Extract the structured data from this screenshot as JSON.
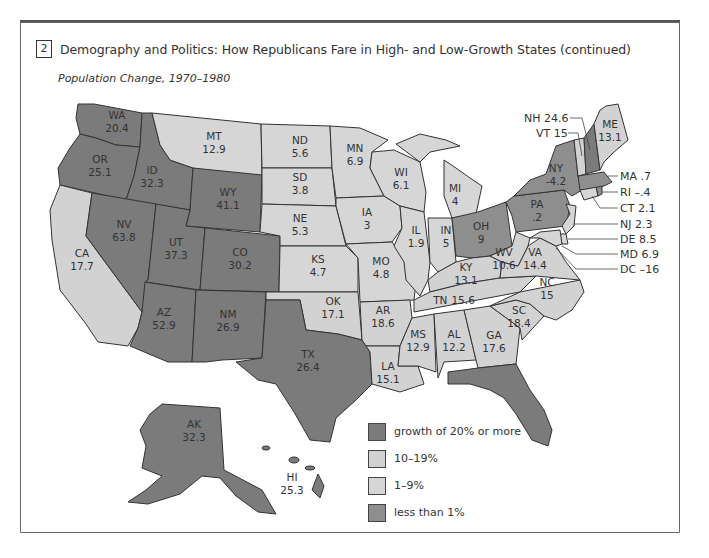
{
  "figure": {
    "number": "2",
    "title": "Demography and Politics: How Republicans Fare in High- and Low-Growth States (continued)",
    "subtitle": "Population Change, 1970–1980"
  },
  "colors": {
    "high": "#7b7b7b",
    "mid": "#d2d2d2",
    "low": "#d6d6d6",
    "neg": "#8e8e8e",
    "border": "#333333"
  },
  "legend": [
    {
      "key": "high",
      "label": "growth of 20% or more",
      "color": "#7b7b7b"
    },
    {
      "key": "mid",
      "label": "10–19%",
      "color": "#d2d2d2"
    },
    {
      "key": "low",
      "label": "1–9%",
      "color": "#d6d6d6"
    },
    {
      "key": "neg",
      "label": "less than 1%",
      "color": "#8e8e8e"
    }
  ],
  "states": {
    "WA": {
      "abbr": "WA",
      "value": "20.4"
    },
    "OR": {
      "abbr": "OR",
      "value": "25.1"
    },
    "CA": {
      "abbr": "CA",
      "value": "17.7"
    },
    "ID": {
      "abbr": "ID",
      "value": "32.3"
    },
    "NV": {
      "abbr": "NV",
      "value": "63.8"
    },
    "MT": {
      "abbr": "MT",
      "value": "12.9"
    },
    "WY": {
      "abbr": "WY",
      "value": "41.1"
    },
    "UT": {
      "abbr": "UT",
      "value": "37.3"
    },
    "CO": {
      "abbr": "CO",
      "value": "30.2"
    },
    "AZ": {
      "abbr": "AZ",
      "value": "52.9"
    },
    "NM": {
      "abbr": "NM",
      "value": "26.9"
    },
    "ND": {
      "abbr": "ND",
      "value": "5.6"
    },
    "SD": {
      "abbr": "SD",
      "value": "3.8"
    },
    "NE": {
      "abbr": "NE",
      "value": "5.3"
    },
    "KS": {
      "abbr": "KS",
      "value": "4.7"
    },
    "OK": {
      "abbr": "OK",
      "value": "17.1"
    },
    "TX": {
      "abbr": "TX",
      "value": "26.4"
    },
    "MN": {
      "abbr": "MN",
      "value": "6.9"
    },
    "IA": {
      "abbr": "IA",
      "value": "3"
    },
    "MO": {
      "abbr": "MO",
      "value": "4.8"
    },
    "AR": {
      "abbr": "AR",
      "value": "18.6"
    },
    "LA": {
      "abbr": "LA",
      "value": "15.1"
    },
    "WI": {
      "abbr": "WI",
      "value": "6.1"
    },
    "IL": {
      "abbr": "IL",
      "value": "1.9"
    },
    "MI": {
      "abbr": "MI",
      "value": "4"
    },
    "IN": {
      "abbr": "IN",
      "value": "5"
    },
    "OH": {
      "abbr": "OH",
      "value": "9"
    },
    "KY": {
      "abbr": "KY",
      "value": "13.1"
    },
    "TN": {
      "abbr": "TN",
      "value": "15.6"
    },
    "MS": {
      "abbr": "MS",
      "value": "12.9"
    },
    "AL": {
      "abbr": "AL",
      "value": "12.2"
    },
    "GA": {
      "abbr": "GA",
      "value": "17.6"
    },
    "FL": {
      "abbr": "FL",
      "value": "41.1"
    },
    "SC": {
      "abbr": "SC",
      "value": "18.4"
    },
    "NC": {
      "abbr": "NC",
      "value": "15"
    },
    "VA": {
      "abbr": "VA",
      "value": "14.4"
    },
    "WV": {
      "abbr": "WV",
      "value": "10.6"
    },
    "PA": {
      "abbr": "PA",
      "value": ".2"
    },
    "NY": {
      "abbr": "NY",
      "value": "-4.2"
    },
    "ME": {
      "abbr": "ME",
      "value": "13.1"
    },
    "AK": {
      "abbr": "AK",
      "value": "32.3"
    },
    "HI": {
      "abbr": "HI",
      "value": "25.3"
    }
  },
  "callouts": {
    "NH": "NH 24.6",
    "VT": "VT 15",
    "MA": "MA .7",
    "RI": "RI  –.4",
    "CT": "CT 2.1",
    "NJ": "NJ 2.3",
    "DE": "DE 8.5",
    "MD": "MD 6.9",
    "DC": "DC  –16"
  }
}
